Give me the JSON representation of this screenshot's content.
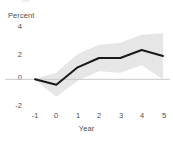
{
  "chart_data": {
    "type": "line",
    "title": "",
    "subtitle": "",
    "xlabel": "Year",
    "ylabel": "Percent",
    "x": [
      -1,
      0,
      1,
      2,
      3,
      4,
      5
    ],
    "xticklabels": [
      "-1",
      "0",
      "1",
      "2",
      "3",
      "4",
      "5"
    ],
    "yticklabels": [
      "4",
      "2",
      "0",
      "-2"
    ],
    "yticks": [
      4,
      2,
      0,
      -2
    ],
    "xlim": [
      -1,
      5
    ],
    "ylim": [
      -2,
      4
    ],
    "grid": false,
    "legend": false,
    "legend_position": "none",
    "zero_line": true,
    "series": [
      {
        "name": "Impulse response",
        "type": "line",
        "color": "#1a1a1a",
        "values": [
          0.0,
          -0.4,
          0.9,
          1.6,
          1.6,
          2.2,
          1.75
        ]
      }
    ],
    "confidence_band": {
      "name": "Confidence interval",
      "color": "#e6e6e6",
      "upper": [
        0.05,
        0.5,
        1.9,
        2.6,
        2.75,
        3.35,
        3.45
      ],
      "lower": [
        -0.05,
        -1.3,
        -0.1,
        0.6,
        0.5,
        1.05,
        0.0
      ]
    },
    "annotations": []
  },
  "axis": {
    "ylabel_text": "Percent",
    "xlabel_text": "Year",
    "yticks": [
      {
        "label": "4"
      },
      {
        "label": "2"
      },
      {
        "label": "0"
      },
      {
        "label": "-2"
      }
    ],
    "xticks": [
      {
        "label": "-1"
      },
      {
        "label": "0"
      },
      {
        "label": "1"
      },
      {
        "label": "2"
      },
      {
        "label": "3"
      },
      {
        "label": "4"
      },
      {
        "label": "5"
      }
    ]
  },
  "colors": {
    "line": "#1a1a1a",
    "band": "#e6e6e6",
    "zero_line": "#c9c9c9",
    "text": "#4f4f4f",
    "background": "#ffffff"
  }
}
